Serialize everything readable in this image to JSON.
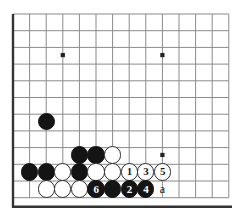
{
  "diagram": {
    "kind": "go-board-problem-diagram",
    "board": {
      "cols": 14,
      "rows": 12,
      "origin_x": 13,
      "origin_y": 14,
      "step_x": 16.6,
      "step_y": 16.7,
      "line_color": "#8a8a8a",
      "edge_color": "#333333",
      "background": "#ffffff"
    },
    "star_points": [
      {
        "col": 3,
        "row": 2.46
      },
      {
        "col": 9,
        "row": 2.46
      },
      {
        "col": 9,
        "row": 8.44
      }
    ],
    "stones": [
      {
        "id": "b-a",
        "color": "black",
        "col": 2,
        "row": 6.46,
        "label": ""
      },
      {
        "id": "b-b",
        "color": "black",
        "col": 4,
        "row": 8.44,
        "label": ""
      },
      {
        "id": "b-c",
        "color": "black",
        "col": 5,
        "row": 8.44,
        "label": ""
      },
      {
        "id": "w-a",
        "color": "white",
        "col": 6,
        "row": 8.44,
        "label": ""
      },
      {
        "id": "b-d",
        "color": "black",
        "col": 1,
        "row": 9.46,
        "label": ""
      },
      {
        "id": "b-e",
        "color": "black",
        "col": 2,
        "row": 9.46,
        "label": ""
      },
      {
        "id": "w-b",
        "color": "white",
        "col": 3,
        "row": 9.46,
        "label": ""
      },
      {
        "id": "b-f",
        "color": "black",
        "col": 4,
        "row": 9.46,
        "label": ""
      },
      {
        "id": "w-c",
        "color": "white",
        "col": 5,
        "row": 9.46,
        "label": ""
      },
      {
        "id": "w-d",
        "color": "white",
        "col": 6,
        "row": 9.46,
        "label": ""
      },
      {
        "id": "w-1",
        "color": "white",
        "col": 7,
        "row": 9.46,
        "label": "1"
      },
      {
        "id": "w-3",
        "color": "white",
        "col": 8,
        "row": 9.46,
        "label": "3"
      },
      {
        "id": "w-5",
        "color": "white",
        "col": 9,
        "row": 9.46,
        "label": "5"
      },
      {
        "id": "w-e",
        "color": "white",
        "col": 2,
        "row": 10.48,
        "label": ""
      },
      {
        "id": "w-f",
        "color": "white",
        "col": 3,
        "row": 10.48,
        "label": ""
      },
      {
        "id": "w-g",
        "color": "white",
        "col": 4,
        "row": 10.48,
        "label": ""
      },
      {
        "id": "b-6",
        "color": "black",
        "col": 5,
        "row": 10.48,
        "label": "6"
      },
      {
        "id": "b-g",
        "color": "black",
        "col": 6,
        "row": 10.48,
        "label": ""
      },
      {
        "id": "b-2",
        "color": "black",
        "col": 7,
        "row": 10.48,
        "label": "2"
      },
      {
        "id": "b-4",
        "color": "black",
        "col": 8,
        "row": 10.48,
        "label": "4"
      }
    ],
    "markers": [
      {
        "id": "mark-a",
        "text": "a",
        "col": 9,
        "row": 10.48
      }
    ],
    "stone_radius": 8.6
  }
}
